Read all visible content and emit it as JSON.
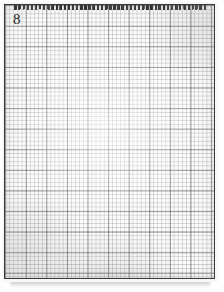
{
  "page": {
    "plate_number": "8",
    "medium": "graph-paper chart",
    "background_color": "#f7f7f5",
    "frame_color": "#3a3a3a",
    "grid_minor_color": "#6e737d",
    "grid_major_color": "#464b55",
    "stitch_color": "#333336"
  },
  "chart": {
    "title": "8",
    "type": "grid-pattern",
    "columns": 51,
    "rows": 67,
    "cell_px": 4.12,
    "major_every": 5,
    "motif": "concentric diamond lozenge with central diamond eye",
    "symmetry": "four-fold (horizontal and vertical mirror)",
    "stitch_glyph": "short vertical dash filling one cell",
    "symbol_counts": {
      "filled_cells": 534,
      "empty_cells": 2883
    },
    "bounds": {
      "left_col": 2,
      "right_col": 48,
      "top_row": 7,
      "bottom_row": 60
    },
    "center": {
      "col": 25,
      "row": 33
    },
    "rings": [
      {
        "name": "outer-lozenge",
        "half_width_cols": 23,
        "half_height_rows": 26,
        "thickness_cells": 3
      },
      {
        "name": "middle-lozenge",
        "half_width_cols": 14,
        "half_height_rows": 16,
        "thickness_cells": 3
      },
      {
        "name": "inner-eye",
        "half_width_cols": 5,
        "half_height_rows": 6,
        "thickness_cells": 2
      }
    ]
  },
  "chart_data": {
    "type": "heatmap",
    "title": "8",
    "xlabel": "",
    "ylabel": "",
    "grid": true,
    "legend": "none",
    "cols": 51,
    "rows": 67,
    "note": "Binary stitch chart. Each listed row gives the column indices (0-based) of filled cells.",
    "filled_rows": [
      {
        "row": 7,
        "cols": [
          25
        ]
      },
      {
        "row": 8,
        "cols": [
          24,
          25,
          26
        ]
      },
      {
        "row": 9,
        "cols": [
          23,
          24,
          26,
          27
        ]
      },
      {
        "row": 10,
        "cols": [
          22,
          23,
          27,
          28
        ]
      },
      {
        "row": 11,
        "cols": [
          21,
          22,
          28,
          29
        ]
      },
      {
        "row": 12,
        "cols": [
          20,
          21,
          29,
          30
        ]
      },
      {
        "row": 13,
        "cols": [
          19,
          20,
          30,
          31
        ]
      },
      {
        "row": 14,
        "cols": [
          18,
          19,
          31,
          32
        ]
      },
      {
        "row": 15,
        "cols": [
          17,
          18,
          32,
          33
        ]
      },
      {
        "row": 16,
        "cols": [
          16,
          17,
          25,
          33,
          34
        ]
      },
      {
        "row": 17,
        "cols": [
          15,
          16,
          24,
          25,
          26,
          34,
          35
        ]
      },
      {
        "row": 18,
        "cols": [
          14,
          15,
          23,
          24,
          26,
          27,
          35,
          36
        ]
      },
      {
        "row": 19,
        "cols": [
          13,
          14,
          22,
          23,
          27,
          28,
          36,
          37
        ]
      },
      {
        "row": 20,
        "cols": [
          12,
          13,
          21,
          22,
          28,
          29,
          37,
          38
        ]
      },
      {
        "row": 21,
        "cols": [
          11,
          12,
          20,
          21,
          29,
          30,
          38,
          39
        ]
      },
      {
        "row": 22,
        "cols": [
          10,
          11,
          19,
          20,
          30,
          31,
          39,
          40
        ]
      },
      {
        "row": 23,
        "cols": [
          9,
          10,
          18,
          19,
          31,
          32,
          40,
          41
        ]
      },
      {
        "row": 24,
        "cols": [
          8,
          9,
          17,
          18,
          32,
          33,
          41,
          42
        ]
      },
      {
        "row": 25,
        "cols": [
          7,
          8,
          16,
          17,
          33,
          34,
          42,
          43
        ]
      },
      {
        "row": 26,
        "cols": [
          6,
          7,
          15,
          16,
          34,
          35,
          43,
          44
        ]
      },
      {
        "row": 27,
        "cols": [
          5,
          6,
          14,
          15,
          25,
          35,
          36,
          44,
          45
        ]
      },
      {
        "row": 28,
        "cols": [
          4,
          5,
          13,
          14,
          24,
          25,
          26,
          36,
          37,
          45,
          46
        ]
      },
      {
        "row": 29,
        "cols": [
          3,
          4,
          12,
          13,
          23,
          24,
          26,
          27,
          37,
          38,
          46,
          47
        ]
      },
      {
        "row": 30,
        "cols": [
          2,
          3,
          11,
          12,
          22,
          23,
          27,
          28,
          38,
          39,
          47,
          48
        ]
      },
      {
        "row": 31,
        "cols": [
          2,
          11,
          21,
          22,
          28,
          29,
          39,
          48
        ]
      },
      {
        "row": 32,
        "cols": [
          2,
          11,
          21,
          29,
          39,
          48
        ]
      },
      {
        "row": 33,
        "cols": [
          2,
          11,
          20,
          30,
          39,
          48
        ]
      },
      {
        "row": 34,
        "cols": [
          2,
          11,
          21,
          29,
          39,
          48
        ]
      },
      {
        "row": 35,
        "cols": [
          2,
          11,
          21,
          22,
          28,
          29,
          39,
          48
        ]
      },
      {
        "row": 36,
        "cols": [
          2,
          3,
          11,
          12,
          22,
          23,
          27,
          28,
          38,
          39,
          47,
          48
        ]
      },
      {
        "row": 37,
        "cols": [
          3,
          4,
          12,
          13,
          23,
          24,
          26,
          27,
          37,
          38,
          46,
          47
        ]
      },
      {
        "row": 38,
        "cols": [
          4,
          5,
          13,
          14,
          24,
          25,
          26,
          36,
          37,
          45,
          46
        ]
      },
      {
        "row": 39,
        "cols": [
          5,
          6,
          14,
          15,
          25,
          35,
          36,
          44,
          45
        ]
      },
      {
        "row": 40,
        "cols": [
          6,
          7,
          15,
          16,
          34,
          35,
          43,
          44
        ]
      },
      {
        "row": 41,
        "cols": [
          7,
          8,
          16,
          17,
          33,
          34,
          42,
          43
        ]
      },
      {
        "row": 42,
        "cols": [
          8,
          9,
          17,
          18,
          32,
          33,
          41,
          42
        ]
      },
      {
        "row": 43,
        "cols": [
          9,
          10,
          18,
          19,
          31,
          32,
          40,
          41
        ]
      },
      {
        "row": 44,
        "cols": [
          10,
          11,
          19,
          20,
          30,
          31,
          39,
          40
        ]
      },
      {
        "row": 45,
        "cols": [
          11,
          12,
          20,
          21,
          29,
          30,
          38,
          39
        ]
      },
      {
        "row": 46,
        "cols": [
          12,
          13,
          21,
          22,
          28,
          29,
          37,
          38
        ]
      },
      {
        "row": 47,
        "cols": [
          13,
          14,
          22,
          23,
          27,
          28,
          36,
          37
        ]
      },
      {
        "row": 48,
        "cols": [
          14,
          15,
          23,
          24,
          26,
          27,
          35,
          36
        ]
      },
      {
        "row": 49,
        "cols": [
          15,
          16,
          24,
          25,
          26,
          34,
          35
        ]
      },
      {
        "row": 50,
        "cols": [
          16,
          17,
          25,
          33,
          34
        ]
      },
      {
        "row": 51,
        "cols": [
          17,
          18,
          32,
          33
        ]
      },
      {
        "row": 52,
        "cols": [
          18,
          19,
          31,
          32
        ]
      },
      {
        "row": 53,
        "cols": [
          19,
          20,
          30,
          31
        ]
      },
      {
        "row": 54,
        "cols": [
          20,
          21,
          29,
          30
        ]
      },
      {
        "row": 55,
        "cols": [
          21,
          22,
          28,
          29
        ]
      },
      {
        "row": 56,
        "cols": [
          22,
          23,
          27,
          28
        ]
      },
      {
        "row": 57,
        "cols": [
          23,
          24,
          26,
          27
        ]
      },
      {
        "row": 58,
        "cols": [
          24,
          25,
          26
        ]
      },
      {
        "row": 59,
        "cols": [
          25
        ]
      },
      {
        "row": 60,
        "cols": [
          25
        ]
      }
    ]
  }
}
